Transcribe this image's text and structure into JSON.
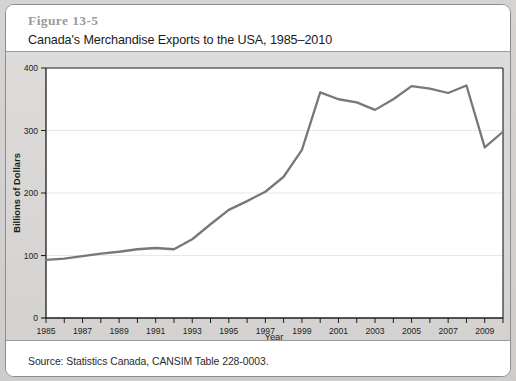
{
  "figure": {
    "number": "Figure 13-5",
    "title": "Canada's Merchandise Exports to the USA, 1985–2010"
  },
  "source": {
    "text": "Source: Statistics Canada, CANSIM Table 228-0003."
  },
  "colors": {
    "line": "#787878",
    "axis": "#1d1d1d",
    "grid": "#e8e8e8",
    "plot_background": "#ffffff",
    "panel_background": "#ffffff",
    "page_background": "#d6d4d2",
    "figure_number_text": "#9b9b9b"
  },
  "chart_data": {
    "type": "line",
    "title": "Canada's Merchandise Exports to the USA, 1985–2010",
    "xlabel": "Year",
    "ylabel": "Billions of Dollars",
    "xlim": [
      1985,
      2010
    ],
    "ylim": [
      0,
      400
    ],
    "yticks": [
      0,
      100,
      200,
      300,
      400
    ],
    "ytick_labels": [
      "0",
      "100",
      "200",
      "300",
      "400"
    ],
    "xticks": [
      1985,
      1986,
      1987,
      1988,
      1989,
      1990,
      1991,
      1992,
      1993,
      1994,
      1995,
      1996,
      1997,
      1998,
      1999,
      2000,
      2001,
      2002,
      2003,
      2004,
      2005,
      2006,
      2007,
      2008,
      2009,
      2010
    ],
    "xtick_labels_shown": [
      "1985",
      "1987",
      "1989",
      "1991",
      "1993",
      "1995",
      "1997",
      "1999",
      "2001",
      "2003",
      "2005",
      "2007",
      "2009"
    ],
    "xtick_label_interval": 2,
    "grid": "horizontal",
    "legend": "none",
    "x": [
      1985,
      1986,
      1987,
      1988,
      1989,
      1990,
      1991,
      1992,
      1993,
      1994,
      1995,
      1996,
      1997,
      1998,
      1999,
      2000,
      2001,
      2002,
      2003,
      2004,
      2005,
      2006,
      2007,
      2008,
      2009,
      2010
    ],
    "values": [
      93,
      95,
      99,
      103,
      106,
      110,
      112,
      110,
      126,
      150,
      173,
      187,
      202,
      226,
      269,
      361,
      350,
      345,
      333,
      350,
      371,
      367,
      360,
      372,
      273,
      298
    ],
    "series": [
      {
        "name": "Merchandise exports to the USA",
        "values": [
          93,
          95,
          99,
          103,
          106,
          110,
          112,
          110,
          126,
          150,
          173,
          187,
          202,
          226,
          269,
          361,
          350,
          345,
          333,
          350,
          371,
          367,
          360,
          372,
          273,
          298
        ]
      }
    ]
  }
}
